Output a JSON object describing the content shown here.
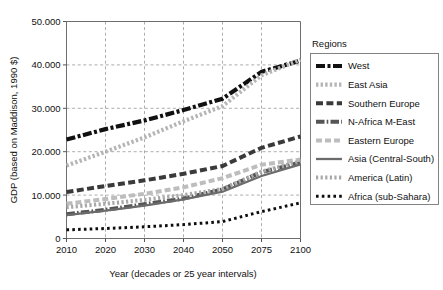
{
  "chart_data": {
    "type": "line",
    "title": "",
    "xlabel": "Year (decades or 25 year intervals)",
    "ylabel": "GDP (based on Maddison, 1990 $)",
    "categories": [
      "2010",
      "2020",
      "2030",
      "2040",
      "2050",
      "2075",
      "2100"
    ],
    "x_tick_labels": [
      "2010",
      "2020",
      "2030",
      "2040",
      "2050",
      "2075",
      "2100"
    ],
    "y_tick_labels": [
      "0",
      "10.000",
      "20.000",
      "30.000",
      "40.000",
      "50.000"
    ],
    "y_tick_values": [
      0,
      10000,
      20000,
      30000,
      40000,
      50000
    ],
    "ylim": [
      0,
      50000
    ],
    "grid": "horizontal-and-vertical-dashed",
    "legend_position": "right",
    "legend_title": "Regions",
    "series": [
      {
        "name": "West",
        "values": [
          22800,
          25200,
          27200,
          29600,
          32200,
          38400,
          41000
        ],
        "color": "#111111",
        "dash": "9 2.5 3 2.5",
        "width": 4.2
      },
      {
        "name": "East Asia",
        "values": [
          16800,
          20000,
          23300,
          27000,
          30500,
          37600,
          41200
        ],
        "color": "#b5b5b5",
        "dash": "2.4 2.2",
        "width": 4.2
      },
      {
        "name": "Southern Europe",
        "values": [
          10700,
          12100,
          13400,
          14900,
          16700,
          20900,
          23500
        ],
        "color": "#3a3a3a",
        "dash": "7 3.4",
        "width": 4.0
      },
      {
        "name": "N-Africa M-East",
        "values": [
          5600,
          6600,
          7900,
          9200,
          11300,
          15300,
          17500
        ],
        "color": "#555555",
        "dash": "8.5 2.2 1.6 2.2",
        "width": 4.0
      },
      {
        "name": "Eastern Europe",
        "values": [
          8000,
          9100,
          10300,
          11800,
          13900,
          17000,
          18200
        ],
        "color": "#bdbdbd",
        "dash": "6 3",
        "width": 4.0
      },
      {
        "name": "Asia (Central-South)",
        "values": [
          5400,
          6400,
          7600,
          9000,
          10800,
          14400,
          17100
        ],
        "color": "#6b6b6b",
        "dash": "none",
        "width": 2.3
      },
      {
        "name": "America (Latin)",
        "values": [
          7200,
          8000,
          8900,
          10000,
          11400,
          15400,
          17800
        ],
        "color": "#a8a8a8",
        "dash": "2.2 2.4",
        "width": 4.0
      },
      {
        "name": "Africa (sub-Sahara)",
        "values": [
          2000,
          2300,
          2700,
          3200,
          3900,
          6200,
          8200
        ],
        "color": "#0d0d0d",
        "dash": "2.6 3.2",
        "width": 3.0
      }
    ]
  },
  "legend": {
    "title": "Regions",
    "items": [
      {
        "label": "West"
      },
      {
        "label": "East Asia"
      },
      {
        "label": "Southern Europe"
      },
      {
        "label": "N-Africa M-East"
      },
      {
        "label": "Eastern Europe"
      },
      {
        "label": "Asia (Central-South)"
      },
      {
        "label": "America (Latin)"
      },
      {
        "label": "Africa (sub-Sahara)"
      }
    ]
  },
  "axes": {
    "x_title": "Year (decades or 25 year intervals)",
    "y_title": "GDP (based on Maddison, 1990 $)"
  }
}
